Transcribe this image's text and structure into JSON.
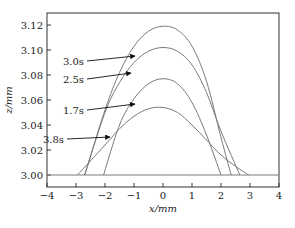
{
  "chart_data": {
    "type": "line",
    "title": "",
    "xlabel": "x/mm",
    "ylabel": "z/mm",
    "xlim": [
      -4,
      4
    ],
    "ylim": [
      2.984,
      3.13
    ],
    "xticks": [
      -4,
      -3,
      -2,
      -1,
      0,
      1,
      2,
      3,
      4
    ],
    "xtick_labels": [
      "−4",
      "−3",
      "−2",
      "−1",
      "0",
      "1",
      "2",
      "3",
      "4"
    ],
    "yticks": [
      3.0,
      3.02,
      3.04,
      3.06,
      3.08,
      3.1,
      3.12
    ],
    "ytick_labels": [
      "3.00",
      "3.02",
      "3.04",
      "3.06",
      "3.08",
      "3.10",
      "3.12"
    ],
    "grid": false,
    "legend": "none (inline arrow annotations)",
    "baseline": {
      "x": [
        -4,
        4
      ],
      "y": [
        3.0,
        3.0
      ]
    },
    "series": [
      {
        "name": "3.0s",
        "x": [
          -2.7,
          -2.0,
          -1.5,
          -1.0,
          -0.5,
          0.0,
          0.5,
          1.0,
          1.5,
          2.0,
          2.35
        ],
        "y": [
          3.0,
          3.052,
          3.082,
          3.103,
          3.115,
          3.119,
          3.116,
          3.103,
          3.075,
          3.03,
          3.0
        ]
      },
      {
        "name": "2.5s",
        "x": [
          -2.7,
          -2.0,
          -1.5,
          -1.0,
          -0.5,
          0.0,
          0.5,
          1.0,
          1.5,
          2.0,
          2.65
        ],
        "y": [
          3.0,
          3.05,
          3.074,
          3.09,
          3.099,
          3.102,
          3.099,
          3.088,
          3.066,
          3.035,
          3.0
        ]
      },
      {
        "name": "1.7s",
        "x": [
          -2.05,
          -1.5,
          -1.0,
          -0.5,
          0.0,
          0.5,
          1.0,
          1.5,
          2.0
        ],
        "y": [
          3.0,
          3.04,
          3.061,
          3.073,
          3.077,
          3.073,
          3.058,
          3.032,
          3.0
        ]
      },
      {
        "name": "3.8s",
        "x": [
          -2.95,
          -2.0,
          -1.5,
          -1.0,
          -0.5,
          0.0,
          0.5,
          1.0,
          1.5,
          2.0,
          2.5,
          2.95
        ],
        "y": [
          3.0,
          3.024,
          3.037,
          3.047,
          3.053,
          3.054,
          3.05,
          3.04,
          3.028,
          3.016,
          3.007,
          3.0
        ]
      }
    ],
    "annotations": [
      {
        "text": "3.0s",
        "label_px": [
          84,
          61
        ],
        "arrow_to_px": [
          135,
          56
        ]
      },
      {
        "text": "2.5s",
        "label_px": [
          84,
          79
        ],
        "arrow_to_px": [
          131,
          73
        ]
      },
      {
        "text": "1.7s",
        "label_px": [
          84,
          110
        ],
        "arrow_to_px": [
          135,
          104
        ]
      },
      {
        "text": "3.8s",
        "label_px": [
          64,
          139
        ],
        "arrow_to_px": [
          110,
          137
        ]
      }
    ]
  },
  "style": {
    "curve_color": "#7a7a7a",
    "frame_color": "#333333",
    "arrow_color": "#111111"
  }
}
